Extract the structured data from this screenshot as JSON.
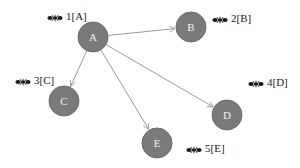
{
  "diagram": {
    "type": "directed-graph",
    "colors": {
      "node_fill": "#7a7a7a",
      "node_stroke": "#6a6a6a",
      "node_text": "#f2f2f2",
      "edge": "#9a9a9a",
      "label_text": "#222222",
      "icon": "#1a1a1a",
      "background": "#ffffff"
    },
    "nodes": [
      {
        "id": "A",
        "label": "A",
        "x": 93,
        "y": 37,
        "r": 15,
        "side_label": "1[A]",
        "side_x": 47,
        "side_y": 10
      },
      {
        "id": "B",
        "label": "B",
        "x": 191,
        "y": 27,
        "r": 15,
        "side_label": "2[B]",
        "side_x": 212,
        "side_y": 12
      },
      {
        "id": "C",
        "label": "C",
        "x": 64,
        "y": 101,
        "r": 15,
        "side_label": "3[C]",
        "side_x": 15,
        "side_y": 74
      },
      {
        "id": "D",
        "label": "D",
        "x": 227,
        "y": 115,
        "r": 15,
        "side_label": "4[D]",
        "side_x": 248,
        "side_y": 76
      },
      {
        "id": "E",
        "label": "E",
        "x": 157,
        "y": 143,
        "r": 15,
        "side_label": "5[E]",
        "side_x": 186,
        "side_y": 142
      }
    ],
    "edges": [
      {
        "from": "A",
        "to": "B"
      },
      {
        "from": "A",
        "to": "C"
      },
      {
        "from": "A",
        "to": "D"
      },
      {
        "from": "A",
        "to": "E"
      }
    ],
    "icon": "ant-icon"
  }
}
